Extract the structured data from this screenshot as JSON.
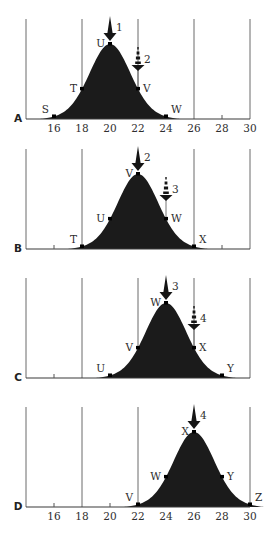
{
  "figure": {
    "colors": {
      "curve_fill": "#1b1b1b",
      "gridline": "#6a6a6a",
      "text": "#2e2e2e",
      "background": "#ffffff"
    }
  },
  "chart_data": [
    {
      "type": "area",
      "panel": "A",
      "mean": 20,
      "x_range": [
        14,
        30
      ],
      "show_tick_labels": true,
      "tick_labels": [
        "16",
        "18",
        "20",
        "22",
        "24",
        "26",
        "28",
        "30"
      ],
      "gridlines": [
        14,
        18,
        22,
        26,
        30
      ],
      "minor_ticks": [
        28
      ],
      "points": [
        {
          "label": "S",
          "x": 16
        },
        {
          "label": "T",
          "x": 18
        },
        {
          "label": "U",
          "x": 20
        },
        {
          "label": "V",
          "x": 22
        },
        {
          "label": "W",
          "x": 24
        }
      ],
      "solid_arrow": {
        "label": "1",
        "x": 20
      },
      "dashed_arrow": {
        "label": "2",
        "x": 22
      }
    },
    {
      "type": "area",
      "panel": "B",
      "mean": 22,
      "x_range": [
        14,
        30
      ],
      "show_tick_labels": false,
      "tick_labels": [],
      "gridlines": [
        14,
        18,
        26,
        30
      ],
      "minor_ticks": [
        16,
        28
      ],
      "points": [
        {
          "label": "T",
          "x": 18
        },
        {
          "label": "U",
          "x": 20
        },
        {
          "label": "V",
          "x": 22
        },
        {
          "label": "W",
          "x": 24
        },
        {
          "label": "X",
          "x": 26
        }
      ],
      "solid_arrow": {
        "label": "2",
        "x": 22
      },
      "dashed_arrow": {
        "label": "3",
        "x": 24
      }
    },
    {
      "type": "area",
      "panel": "C",
      "mean": 24,
      "x_range": [
        14,
        30
      ],
      "show_tick_labels": false,
      "tick_labels": [],
      "gridlines": [
        14,
        18,
        22,
        26,
        30
      ],
      "minor_ticks": [
        16
      ],
      "points": [
        {
          "label": "U",
          "x": 20
        },
        {
          "label": "V",
          "x": 22
        },
        {
          "label": "W",
          "x": 24
        },
        {
          "label": "X",
          "x": 26
        },
        {
          "label": "Y",
          "x": 28
        }
      ],
      "solid_arrow": {
        "label": "3",
        "x": 24
      },
      "dashed_arrow": {
        "label": "4",
        "x": 26
      }
    },
    {
      "type": "area",
      "panel": "D",
      "mean": 26,
      "x_range": [
        14,
        30
      ],
      "show_tick_labels": true,
      "tick_labels": [
        "16",
        "18",
        "20",
        "22",
        "24",
        "26",
        "28",
        "30"
      ],
      "gridlines": [
        14,
        18,
        22,
        30
      ],
      "minor_ticks": [
        16,
        20
      ],
      "points": [
        {
          "label": "V",
          "x": 22
        },
        {
          "label": "W",
          "x": 24
        },
        {
          "label": "X",
          "x": 26
        },
        {
          "label": "Y",
          "x": 28
        },
        {
          "label": "Z",
          "x": 30
        }
      ],
      "solid_arrow": {
        "label": "4",
        "x": 26
      },
      "dashed_arrow": null
    }
  ]
}
